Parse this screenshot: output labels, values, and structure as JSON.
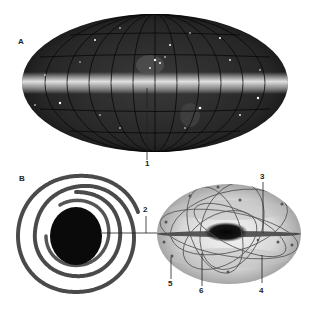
{
  "figure": {
    "panel_a": {
      "label": "A",
      "description": "all-sky map of the Milky Way in galactic coordinates (Aitoff projection)",
      "callouts": [
        {
          "id": "1",
          "label": "1"
        }
      ]
    },
    "panel_b": {
      "label": "B",
      "description": "spiral galaxy face-on view and edge-on view with halo and globular cluster orbits",
      "callouts": [
        {
          "id": "2",
          "label": "2"
        },
        {
          "id": "3",
          "label": "3"
        },
        {
          "id": "4",
          "label": "4"
        },
        {
          "id": "5",
          "label": "5"
        },
        {
          "id": "6",
          "label": "6"
        }
      ]
    }
  },
  "colors": {
    "sky_background": "#1e1e1e",
    "grid_lines": "#0a0a0a",
    "milky_way_band": "#e8e8e8",
    "spiral_arms": "#2a2a2a",
    "halo": "#c8c8c8",
    "label_text": "#222222"
  }
}
